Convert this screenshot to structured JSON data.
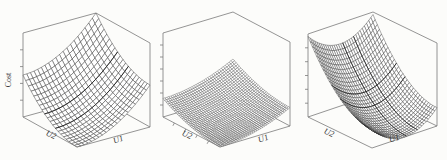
{
  "window": {
    "background": "#fcfcfa",
    "axis_color": "#7a7a7a"
  },
  "chart_data": [
    {
      "type": "surface",
      "title": "",
      "xlabel": "U1",
      "ylabel": "U2",
      "zlabel": "Cost",
      "x_range": [
        -1,
        1
      ],
      "y_range": [
        -1,
        1
      ],
      "z_range": [
        0,
        1
      ],
      "grid_n": 20,
      "z_model": "z = a*(u1-cx)^2 + b*(u2-cy)^2 (quadratic bowl, minimum at front corner u1=1,u2=1)",
      "params": {
        "a": 0.125,
        "b": 0.125,
        "cx": 1,
        "cy": 1
      },
      "ticks": {
        "z_count": 4,
        "u2_count": 0
      },
      "layout_hints": {
        "box": true,
        "numeric_tick_labels": false,
        "legend": false
      },
      "style": {
        "mesh_stroke": "#2e2e2e",
        "mesh_width": 0.45,
        "accent_rows": [],
        "accent_cols": [
          8,
          12
        ],
        "accent_stroke": "#101010",
        "accent_width": 0.75
      }
    },
    {
      "type": "surface",
      "title": "",
      "xlabel": "U1",
      "ylabel": "U2",
      "zlabel": "",
      "x_range": [
        -1,
        1
      ],
      "y_range": [
        -1,
        1
      ],
      "z_range": [
        0,
        0.45
      ],
      "grid_n": 36,
      "z_model": "z = a*(u1-cx)^2 + b*(u2-cy)^2 (shallow flat bowl, minimum at front corner u1=1,u2=1)",
      "params": {
        "a": 0.055,
        "b": 0.055,
        "cx": 1,
        "cy": 1
      },
      "ticks": {
        "z_count": 6,
        "u2_count": 4
      },
      "layout_hints": {
        "box": true,
        "numeric_tick_labels": false,
        "legend": false
      },
      "style": {
        "mesh_stroke": "#222222",
        "mesh_width": 0.3,
        "accent_rows": [],
        "accent_cols": [],
        "accent_stroke": "#101010",
        "accent_width": 0.6
      }
    },
    {
      "type": "surface",
      "title": "",
      "xlabel": "U1",
      "ylabel": "U2",
      "zlabel": "",
      "x_range": [
        -1,
        1
      ],
      "y_range": [
        -1,
        1
      ],
      "z_range": [
        0,
        0.97
      ],
      "grid_n": 30,
      "z_model": "z = a*(u1-cx)^2 + b*(u2-cy)^2 (anisotropic valley, high at back-left, minimum mid front-right edge)",
      "params": {
        "a": 0.1875,
        "b": 0.22,
        "cx": 1,
        "cy": 0
      },
      "ticks": {
        "z_count": 5,
        "u2_count": 0
      },
      "layout_hints": {
        "box": true,
        "numeric_tick_labels": false,
        "legend": false
      },
      "style": {
        "mesh_stroke": "#2e2e2e",
        "mesh_width": 0.4,
        "accent_rows": [
          9,
          14
        ],
        "accent_cols": [
          11,
          15
        ],
        "accent_stroke": "#101010",
        "accent_width": 0.7
      }
    }
  ]
}
